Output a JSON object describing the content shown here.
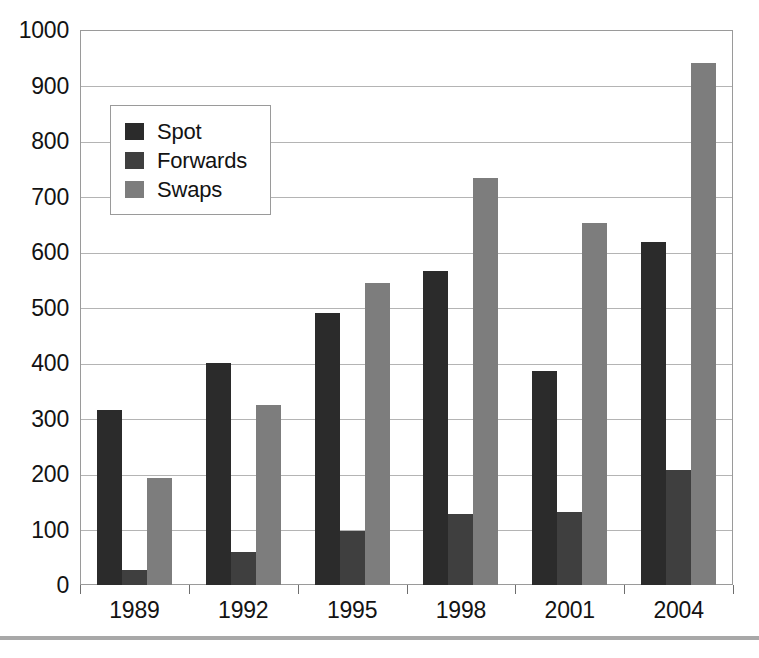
{
  "chart_data": {
    "type": "bar",
    "title": "",
    "subtitle": "",
    "xlabel": "",
    "ylabel": "",
    "categories": [
      "1989",
      "1992",
      "1995",
      "1998",
      "2001",
      "2004"
    ],
    "series": [
      {
        "name": "Spot",
        "color": "#2b2b2b",
        "values": [
          315,
          400,
          490,
          565,
          385,
          618
        ]
      },
      {
        "name": "Forwards",
        "color": "#3f3f3f",
        "values": [
          27,
          60,
          98,
          128,
          131,
          208
        ]
      },
      {
        "name": "Swaps",
        "color": "#7d7d7d",
        "values": [
          193,
          325,
          545,
          733,
          652,
          940
        ]
      }
    ],
    "ylim": [
      0,
      1000
    ],
    "ytick_labels": [
      "0",
      "100",
      "200",
      "300",
      "400",
      "500",
      "600",
      "700",
      "800",
      "900",
      "1000"
    ],
    "ytick_values": [
      0,
      100,
      200,
      300,
      400,
      500,
      600,
      700,
      800,
      900,
      1000
    ],
    "grid": true,
    "grid_axis": "y",
    "legend_position": "upper-left",
    "bar_mode": "grouped"
  },
  "legend": {
    "items": [
      {
        "label": "Spot"
      },
      {
        "label": "Forwards"
      },
      {
        "label": "Swaps"
      }
    ]
  },
  "colors": {
    "spot": "#2b2b2b",
    "forwards": "#3f3f3f",
    "swaps": "#7d7d7d",
    "gridline": "#b4b4b4",
    "frame": "#9a9a9a",
    "text": "#131313",
    "rule": "#a8a8a8"
  }
}
